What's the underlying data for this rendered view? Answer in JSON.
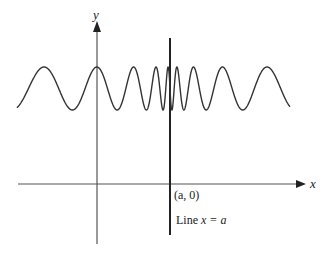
{
  "figure": {
    "axes": {
      "x_label": "x",
      "y_label": "y"
    },
    "curve": {
      "description": "oscillating curve whose frequency increases as it approaches x = a",
      "color": "#333333"
    },
    "vertical_line": {
      "point_label": "(a, 0)",
      "line_label_prefix": "Line ",
      "line_label_eq": "x = a"
    },
    "colors": {
      "axis": "#555555",
      "vertical_line": "#222222",
      "curve": "#333333"
    }
  }
}
